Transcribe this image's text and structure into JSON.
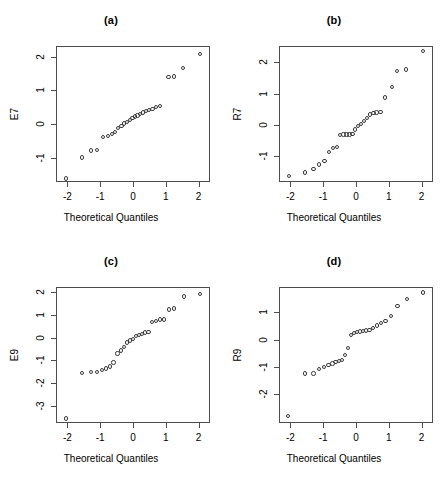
{
  "figure": {
    "width": 445,
    "height": 481,
    "background": "#ffffff",
    "point_color": "#3a3a3a",
    "axis_color": "#4d4d4d"
  },
  "chart_data": [
    {
      "type": "scatter",
      "title": "(a)",
      "xlabel": "Theoretical Quantiles",
      "ylabel": "E7",
      "xlim": [
        -2.35,
        2.35
      ],
      "ylim": [
        -1.72,
        2.32
      ],
      "xticks": [
        -2,
        -1,
        0,
        1,
        2
      ],
      "yticks": [
        -1,
        0,
        1,
        2
      ],
      "grid": false,
      "legend": "none",
      "x": [
        -2.05,
        -1.55,
        -1.28,
        -1.09,
        -0.91,
        -0.77,
        -0.65,
        -0.55,
        -0.45,
        -0.35,
        -0.27,
        -0.18,
        -0.1,
        -0.02,
        0.06,
        0.14,
        0.22,
        0.31,
        0.4,
        0.49,
        0.6,
        0.71,
        0.83,
        1.08,
        1.26,
        1.53,
        2.05
      ],
      "y": [
        -1.62,
        -0.99,
        -0.78,
        -0.77,
        -0.39,
        -0.35,
        -0.29,
        -0.23,
        -0.12,
        -0.05,
        0.02,
        0.06,
        0.12,
        0.18,
        0.22,
        0.26,
        0.3,
        0.34,
        0.38,
        0.42,
        0.45,
        0.5,
        0.54,
        1.4,
        1.41,
        1.66,
        2.08
      ]
    },
    {
      "type": "scatter",
      "title": "(b)",
      "xlabel": "Theoretical Quantiles",
      "ylabel": "R7",
      "xlim": [
        -2.35,
        2.35
      ],
      "ylim": [
        -1.82,
        2.52
      ],
      "xticks": [
        -2,
        -1,
        0,
        1,
        2
      ],
      "yticks": [
        -1,
        0,
        1,
        2
      ],
      "grid": false,
      "legend": "none",
      "x": [
        -2.05,
        -1.55,
        -1.3,
        -1.12,
        -0.96,
        -0.82,
        -0.7,
        -0.58,
        -0.48,
        -0.38,
        -0.29,
        -0.2,
        -0.11,
        -0.03,
        0.06,
        0.15,
        0.24,
        0.33,
        0.43,
        0.53,
        0.63,
        0.75,
        0.89,
        1.1,
        1.26,
        1.53,
        2.05
      ],
      "y": [
        -1.63,
        -1.52,
        -1.41,
        -1.26,
        -1.15,
        -0.86,
        -0.73,
        -0.71,
        -0.33,
        -0.31,
        -0.3,
        -0.3,
        -0.29,
        -0.15,
        -0.04,
        0.04,
        0.12,
        0.22,
        0.34,
        0.38,
        0.4,
        0.42,
        0.88,
        1.22,
        1.72,
        1.77,
        2.36
      ]
    },
    {
      "type": "scatter",
      "title": "(c)",
      "xlabel": "Theoretical Quantiles",
      "ylabel": "E9",
      "xlim": [
        -2.35,
        2.35
      ],
      "ylim": [
        -3.75,
        2.22
      ],
      "xticks": [
        -2,
        -1,
        0,
        1,
        2
      ],
      "yticks": [
        -3,
        -2,
        -1,
        0,
        1,
        2
      ],
      "grid": false,
      "legend": "none",
      "x": [
        -2.05,
        -1.55,
        -1.28,
        -1.1,
        -0.95,
        -0.82,
        -0.7,
        -0.59,
        -0.47,
        -0.37,
        -0.27,
        -0.18,
        -0.09,
        0.0,
        0.09,
        0.18,
        0.27,
        0.37,
        0.47,
        0.58,
        0.7,
        0.82,
        0.95,
        1.1,
        1.25,
        1.55,
        2.05
      ],
      "y": [
        -3.55,
        -1.55,
        -1.51,
        -1.5,
        -1.43,
        -1.35,
        -1.27,
        -1.1,
        -0.7,
        -0.57,
        -0.42,
        -0.22,
        -0.13,
        -0.06,
        0.06,
        0.12,
        0.16,
        0.22,
        0.25,
        0.68,
        0.74,
        0.8,
        0.8,
        1.24,
        1.28,
        1.8,
        1.92
      ]
    },
    {
      "type": "scatter",
      "title": "(d)",
      "xlabel": "Theoretical Quantiles",
      "ylabel": "R9",
      "xlim": [
        -2.35,
        2.35
      ],
      "ylim": [
        -3.05,
        1.92
      ],
      "xticks": [
        -2,
        -1,
        0,
        1,
        2
      ],
      "yticks": [
        -2,
        -1,
        0,
        1
      ],
      "grid": false,
      "legend": "none",
      "x": [
        -2.07,
        -1.55,
        -1.3,
        -1.12,
        -0.98,
        -0.84,
        -0.72,
        -0.62,
        -0.52,
        -0.42,
        -0.33,
        -0.24,
        -0.15,
        -0.06,
        0.03,
        0.12,
        0.21,
        0.31,
        0.41,
        0.52,
        0.64,
        0.76,
        0.9,
        1.07,
        1.27,
        1.56,
        2.05
      ],
      "y": [
        -2.8,
        -1.24,
        -1.24,
        -1.08,
        -1.0,
        -0.93,
        -0.88,
        -0.81,
        -0.78,
        -0.75,
        -0.56,
        -0.3,
        0.17,
        0.24,
        0.28,
        0.3,
        0.31,
        0.33,
        0.34,
        0.42,
        0.52,
        0.6,
        0.68,
        0.85,
        1.22,
        1.48,
        1.72
      ]
    }
  ]
}
